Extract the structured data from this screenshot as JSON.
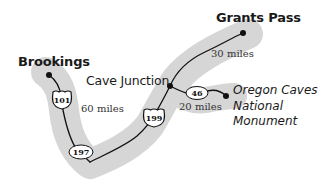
{
  "map": {
    "colors": {
      "background": "#ffffff",
      "corridor": "#d6d6d6",
      "road": "#111111",
      "text": "#1a1a1a"
    },
    "places": [
      {
        "id": "brookings",
        "name": "Brookings",
        "style": "bold",
        "x": 49,
        "y": 75
      },
      {
        "id": "cave_junction",
        "name": "Cave Junction",
        "style": "regular",
        "x": 170,
        "y": 86
      },
      {
        "id": "grants_pass",
        "name": "Grants Pass",
        "style": "bold",
        "x": 243,
        "y": 33
      },
      {
        "id": "oregon_caves",
        "name_lines": [
          "Oregon Caves",
          "National",
          "Monument"
        ],
        "style": "italic",
        "x": 226,
        "y": 96
      }
    ],
    "routes": [
      {
        "id": "us101",
        "label": "101",
        "type": "us-shield"
      },
      {
        "id": "us199",
        "label": "199",
        "type": "us-shield"
      },
      {
        "id": "or197",
        "label": "197",
        "type": "oval"
      },
      {
        "id": "or46",
        "label": "46",
        "type": "oval"
      }
    ],
    "distances": [
      {
        "id": "d60",
        "text": "60 miles",
        "segment": "Brookings – Cave Junction"
      },
      {
        "id": "d30",
        "text": "30 miles",
        "segment": "Cave Junction – Grants Pass"
      },
      {
        "id": "d20",
        "text": "20 miles",
        "segment": "Cave Junction – Oregon Caves National Monument"
      }
    ]
  }
}
